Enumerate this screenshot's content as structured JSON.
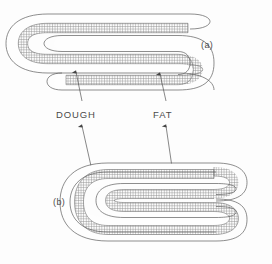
{
  "figure": {
    "background_color": "#fdfdfd",
    "line_color": "#5d5d5d",
    "fat_hatch_color": "#8a8a8a",
    "dough_color": "#fefefe",
    "labels": {
      "dough": "DOUGH",
      "fat": "FAT",
      "panel_a": "(a)",
      "panel_b": "(b)"
    },
    "panels": [
      {
        "tag": "(a)",
        "description": "Fewer folds — fat layer folded through three passes",
        "fold_count": 3
      },
      {
        "tag": "(b)",
        "description": "More folds — fat layer folded through five passes",
        "fold_count": 5
      }
    ],
    "legend_items": [
      {
        "name": "DOUGH",
        "appearance": "white band with thin outline"
      },
      {
        "name": "FAT",
        "appearance": "grey cross-hatched band"
      }
    ]
  }
}
